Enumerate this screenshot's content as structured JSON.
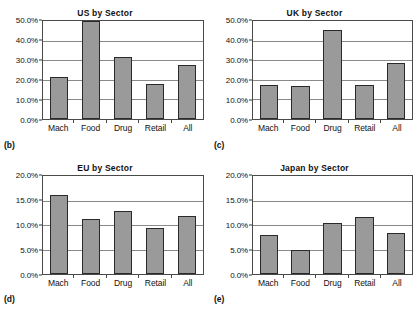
{
  "figure": {
    "panels": [
      {
        "label": "(b)",
        "title": "US by Sector",
        "y_ticks": [
          "50.0%",
          "40.0%",
          "30.0%",
          "20.0%",
          "10.0%",
          "0.0%"
        ],
        "ymax": 50.0,
        "categories": [
          "Mach",
          "Food",
          "Drug",
          "Retail",
          "All"
        ],
        "values": [
          21.5,
          51.0,
          31.4,
          17.8,
          27.6
        ]
      },
      {
        "label": "(c)",
        "title": "UK by Sector",
        "y_ticks": [
          "50.0%",
          "40.0%",
          "30.0%",
          "20.0%",
          "10.0%",
          "0.0%"
        ],
        "ymax": 50.0,
        "categories": [
          "Mach",
          "Food",
          "Drug",
          "Retail",
          "All"
        ],
        "values": [
          17.5,
          16.9,
          45.4,
          17.2,
          28.8
        ]
      },
      {
        "label": "(d)",
        "title": "EU by Sector",
        "y_ticks": [
          "20.0%",
          "15.0%",
          "10.0%",
          "5.0%",
          "0.0%"
        ],
        "ymax": 20.0,
        "categories": [
          "Mach",
          "Food",
          "Drug",
          "Retail",
          "All"
        ],
        "values": [
          16.1,
          11.2,
          12.8,
          9.4,
          11.9
        ]
      },
      {
        "label": "(e)",
        "title": "Japan by Sector",
        "y_ticks": [
          "20.0%",
          "15.0%",
          "10.0%",
          "5.0%",
          "0.0%"
        ],
        "ymax": 20.0,
        "categories": [
          "Mach",
          "Food",
          "Drug",
          "Retail",
          "All"
        ],
        "values": [
          7.9,
          5.0,
          10.4,
          11.6,
          8.3
        ]
      }
    ]
  },
  "chart_data": [
    {
      "type": "bar",
      "title": "US by Sector",
      "panel_label": "(b)",
      "categories": [
        "Mach",
        "Food",
        "Drug",
        "Retail",
        "All"
      ],
      "values": [
        21.5,
        51.0,
        31.4,
        17.8,
        27.6
      ],
      "xlabel": "",
      "ylabel": "",
      "ylim": [
        0,
        50
      ],
      "ytick_labels": [
        "0.0%",
        "10.0%",
        "20.0%",
        "30.0%",
        "40.0%",
        "50.0%"
      ],
      "grid": true,
      "legend": "none",
      "note": "Food bar is clipped at the top of the 50.0% axis"
    },
    {
      "type": "bar",
      "title": "UK by Sector",
      "panel_label": "(c)",
      "categories": [
        "Mach",
        "Food",
        "Drug",
        "Retail",
        "All"
      ],
      "values": [
        17.5,
        16.9,
        45.4,
        17.2,
        28.8
      ],
      "xlabel": "",
      "ylabel": "",
      "ylim": [
        0,
        50
      ],
      "ytick_labels": [
        "0.0%",
        "10.0%",
        "20.0%",
        "30.0%",
        "40.0%",
        "50.0%"
      ],
      "grid": true,
      "legend": "none"
    },
    {
      "type": "bar",
      "title": "EU by Sector",
      "panel_label": "(d)",
      "categories": [
        "Mach",
        "Food",
        "Drug",
        "Retail",
        "All"
      ],
      "values": [
        16.1,
        11.2,
        12.8,
        9.4,
        11.9
      ],
      "xlabel": "",
      "ylabel": "",
      "ylim": [
        0,
        20
      ],
      "ytick_labels": [
        "0.0%",
        "5.0%",
        "10.0%",
        "15.0%",
        "20.0%"
      ],
      "grid": true,
      "legend": "none"
    },
    {
      "type": "bar",
      "title": "Japan by Sector",
      "panel_label": "(e)",
      "categories": [
        "Mach",
        "Food",
        "Drug",
        "Retail",
        "All"
      ],
      "values": [
        7.9,
        5.0,
        10.4,
        11.6,
        8.3
      ],
      "xlabel": "",
      "ylabel": "",
      "ylim": [
        0,
        20
      ],
      "ytick_labels": [
        "0.0%",
        "5.0%",
        "10.0%",
        "15.0%",
        "20.0%"
      ],
      "grid": true,
      "legend": "none"
    }
  ],
  "style": {
    "bar_fill": "#9a9a9a",
    "bar_border": "#2a2a2a",
    "grid_color": "#8a8a8a",
    "axis_color": "#4a4a4a",
    "background": "#ffffff"
  }
}
